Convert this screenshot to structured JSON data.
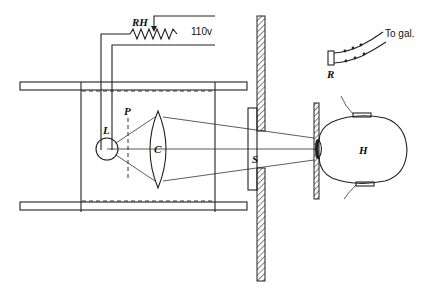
{
  "diagram": {
    "labels": {
      "rheostat": "RH",
      "voltage": "110v",
      "lamp": "L",
      "plate": "P",
      "condenser": "C",
      "shutter": "S",
      "head": "H",
      "resistor": "R",
      "galvanometer": "To gal."
    },
    "components": [
      {
        "id": "RH",
        "description": "Variable rheostat on 110v supply"
      },
      {
        "id": "L",
        "description": "Lamp (light source)"
      },
      {
        "id": "P",
        "description": "Dashed plane / filter position"
      },
      {
        "id": "C",
        "description": "Condenser lens"
      },
      {
        "id": "S",
        "description": "Shutter opening in hatched screen"
      },
      {
        "id": "H",
        "description": "Head of subject with electrodes"
      },
      {
        "id": "R",
        "description": "Resistor leading to galvanometer"
      }
    ],
    "colors": {
      "line": "#222222",
      "background": "#ffffff"
    }
  }
}
